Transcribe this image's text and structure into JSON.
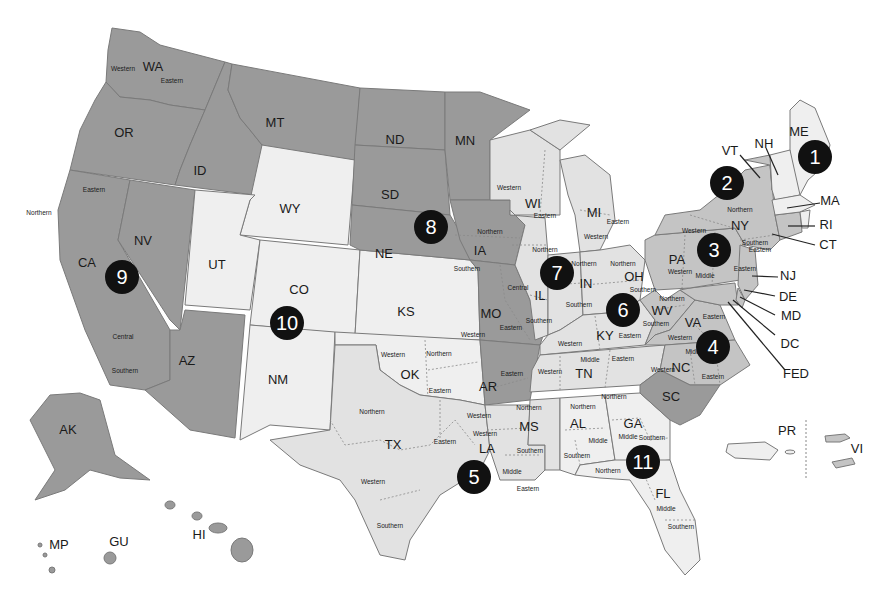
{
  "colors": {
    "dark": "#9a9a9a",
    "mid": "#c4c4c4",
    "light": "#e2e2e2",
    "very_light": "#efefef",
    "marker": "#111111",
    "marker_text": "#ffffff"
  },
  "states": {
    "WA": "WA",
    "OR": "OR",
    "CA": "CA",
    "NV": "NV",
    "ID": "ID",
    "MT": "MT",
    "AZ": "AZ",
    "WY": "WY",
    "UT": "UT",
    "CO": "CO",
    "NM": "NM",
    "KS": "KS",
    "OK": "OK",
    "ND": "ND",
    "SD": "SD",
    "NE": "NE",
    "MN": "MN",
    "IA": "IA",
    "MO": "MO",
    "AR": "AR",
    "TX": "TX",
    "LA": "LA",
    "MS": "MS",
    "WI": "WI",
    "IL": "IL",
    "IN": "IN",
    "MI": "MI",
    "OH": "OH",
    "KY": "KY",
    "TN": "TN",
    "AL": "AL",
    "GA": "GA",
    "FL": "FL",
    "SC": "SC",
    "NC": "NC",
    "VA": "VA",
    "WV": "WV",
    "PA": "PA",
    "NJ": "NJ",
    "DE": "DE",
    "MD": "MD",
    "DC": "DC",
    "FED": "FED",
    "NY": "NY",
    "VT": "VT",
    "CT": "CT",
    "ME": "ME",
    "NH": "NH",
    "MA": "MA",
    "RI": "RI",
    "AK": "AK",
    "HI": "HI",
    "GU": "GU",
    "MP": "MP",
    "PR": "PR",
    "VI": "VI"
  },
  "districts": {
    "wa_w": "Western",
    "wa_e": "Eastern",
    "ca_n": "Northern",
    "ca_e": "Eastern",
    "ca_c": "Central",
    "ca_s": "Southern",
    "ok_w": "Western",
    "ok_n": "Northern",
    "ok_e": "Eastern",
    "tx_n": "Northern",
    "tx_e": "Eastern",
    "tx_w": "Western",
    "tx_s": "Southern",
    "la_w": "Western",
    "la_m": "Middle",
    "la_e": "Eastern",
    "ms_n": "Northern",
    "ms_s": "Southern",
    "ar_e": "Eastern",
    "ar_w": "Western",
    "mo_w": "Western",
    "mo_e": "Eastern",
    "ia_n": "Northern",
    "ia_s": "Southern",
    "wi_w": "Western",
    "wi_e": "Eastern",
    "mi_w": "Western",
    "mi_e": "Eastern",
    "il_n": "Northern",
    "il_c": "Central",
    "il_s": "Southern",
    "in_n": "Northern",
    "in_s": "Southern",
    "oh_n": "Northern",
    "oh_s": "Southern",
    "ky_w": "Western",
    "ky_e": "Eastern",
    "tn_w": "Western",
    "tn_m": "Middle",
    "tn_e": "Eastern",
    "al_n": "Northern",
    "al_m": "Middle",
    "al_s": "Southern",
    "ga_n": "Northern",
    "ga_m": "Middle",
    "ga_s": "Southern",
    "fl_n": "Northern",
    "fl_m": "Middle",
    "fl_s": "Southern",
    "nc_w": "Western",
    "nc_m": "Middle",
    "nc_e": "Eastern",
    "va_w": "Western",
    "va_e": "Eastern",
    "wv_n": "Northern",
    "wv_s": "Southern",
    "pa_w": "Western",
    "pa_m": "Middle",
    "pa_e": "Eastern",
    "ny_w": "Western",
    "ny_n": "Northern",
    "ny_s": "Southern",
    "ny_e": "Eastern"
  },
  "circuits": [
    {
      "number": "1",
      "x": 815,
      "y": 157
    },
    {
      "number": "2",
      "x": 727,
      "y": 183
    },
    {
      "number": "3",
      "x": 714,
      "y": 250
    },
    {
      "number": "4",
      "x": 713,
      "y": 347
    },
    {
      "number": "5",
      "x": 474,
      "y": 477
    },
    {
      "number": "6",
      "x": 623,
      "y": 310
    },
    {
      "number": "7",
      "x": 557,
      "y": 273
    },
    {
      "number": "8",
      "x": 431,
      "y": 227
    },
    {
      "number": "9",
      "x": 122,
      "y": 277
    },
    {
      "number": "10",
      "x": 287,
      "y": 323
    },
    {
      "number": "11",
      "x": 643,
      "y": 462
    }
  ]
}
